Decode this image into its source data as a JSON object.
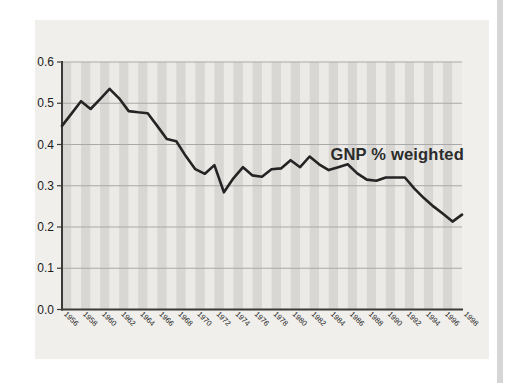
{
  "page": {
    "background": "#ffffff"
  },
  "chart_data": {
    "type": "line",
    "title": "",
    "xlabel": "",
    "ylabel": "",
    "legend": "none",
    "annotation": {
      "text": "GNP % weighted"
    },
    "grid": "horizontal",
    "plot_background": "striped-vertical-year-bands",
    "ylim": [
      0.0,
      0.6
    ],
    "yticks": [
      0.0,
      0.1,
      0.2,
      0.3,
      0.4,
      0.5,
      0.6
    ],
    "xticks": [
      1956,
      1958,
      1960,
      1962,
      1964,
      1966,
      1968,
      1970,
      1972,
      1974,
      1976,
      1978,
      1980,
      1982,
      1984,
      1986,
      1988,
      1990,
      1992,
      1994,
      1996,
      1998
    ],
    "x_tick_rotation_deg": 45,
    "x": [
      1956,
      1957,
      1958,
      1959,
      1960,
      1961,
      1962,
      1963,
      1964,
      1965,
      1966,
      1967,
      1968,
      1969,
      1970,
      1971,
      1972,
      1973,
      1974,
      1975,
      1976,
      1977,
      1978,
      1979,
      1980,
      1981,
      1982,
      1983,
      1984,
      1985,
      1986,
      1987,
      1988,
      1989,
      1990,
      1991,
      1992,
      1993,
      1994,
      1995,
      1996,
      1997,
      1998
    ],
    "series": [
      {
        "name": "GNP % weighted",
        "values": [
          0.445,
          0.475,
          0.505,
          0.486,
          0.51,
          0.535,
          0.512,
          0.481,
          0.478,
          0.476,
          0.445,
          0.413,
          0.408,
          0.372,
          0.34,
          0.329,
          0.35,
          0.284,
          0.318,
          0.345,
          0.325,
          0.322,
          0.34,
          0.342,
          0.362,
          0.345,
          0.371,
          0.352,
          0.338,
          0.345,
          0.352,
          0.33,
          0.315,
          0.312,
          0.32,
          0.32,
          0.32,
          0.293,
          0.27,
          0.25,
          0.232,
          0.213,
          0.23
        ]
      }
    ]
  },
  "colors": {
    "line": "#242424",
    "panel": "#f0efec",
    "stripe_dark": "#d8d7d4",
    "stripe_light": "#eceae7",
    "gridline": "#a9a9a9",
    "axis": "#3a3a3a",
    "label": "#1c1c1c",
    "annotation": "#2b2b2b",
    "page_edge": "#d6d6d6"
  }
}
